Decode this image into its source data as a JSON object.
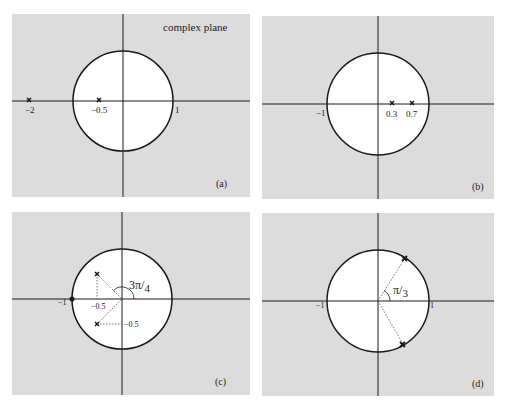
{
  "colors": {
    "panel_bg": "#dcdcdc",
    "disk_fill": "#ffffff",
    "stroke": "#1a1a1a",
    "dotted": "#555555"
  },
  "title": "complex plane",
  "panels": [
    {
      "id": "a",
      "label": "(a)",
      "ticks": {
        "neg1": "",
        "pos1": "1"
      },
      "markers": [
        {
          "x": -2,
          "y": 0,
          "label": "−2"
        },
        {
          "x": -0.5,
          "y": 0,
          "label": "−0.5"
        }
      ]
    },
    {
      "id": "b",
      "label": "(b)",
      "ticks": {
        "neg1": "−1",
        "pos1": ""
      },
      "markers": [
        {
          "x": 0.3,
          "y": 0,
          "label": "0.3"
        },
        {
          "x": 0.7,
          "y": 0,
          "label": "0.7"
        }
      ]
    },
    {
      "id": "c",
      "label": "(c)",
      "ticks": {
        "neg1": "−1",
        "pos1": ""
      },
      "markers": [
        {
          "x": -0.5,
          "y": 0.5
        },
        {
          "x": -0.5,
          "y": -0.5
        }
      ],
      "annotations": {
        "re": "−0.5",
        "im": "−0.5",
        "angle": "3π/4",
        "angle_num": "3π",
        "angle_den": "4"
      },
      "zero": {
        "x": -1,
        "y": 0
      }
    },
    {
      "id": "d",
      "label": "(d)",
      "ticks": {
        "neg1": "−1",
        "pos1": "1"
      },
      "markers": [
        {
          "angle_deg": 60
        },
        {
          "angle_deg": -60
        }
      ],
      "annotations": {
        "angle": "π/3",
        "angle_num": "π",
        "angle_den": "3"
      }
    }
  ]
}
